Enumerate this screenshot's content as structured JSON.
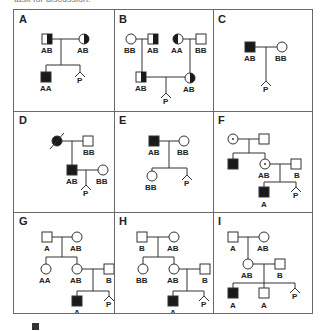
{
  "header_fragment": "task for discussion.",
  "footer_fragment": "",
  "colors": {
    "line": "#333333",
    "fill": "#1a1a1a",
    "border": "#6a6a6a",
    "background": "#ffffff"
  },
  "panels": [
    {
      "id": "A",
      "label": "A",
      "individuals": [
        {
          "sex": "male",
          "status": "carrier-half",
          "genotype": "AB"
        },
        {
          "sex": "female",
          "status": "carrier-half",
          "genotype": "AB"
        },
        {
          "sex": "male",
          "status": "affected",
          "genotype": "AA"
        },
        {
          "sex": "unknown",
          "status": "pregnancy",
          "genotype": "P"
        }
      ]
    },
    {
      "id": "B",
      "label": "B",
      "individuals": [
        {
          "sex": "female",
          "status": "unaffected",
          "genotype": "BB"
        },
        {
          "sex": "male",
          "status": "carrier-half",
          "genotype": "AB"
        },
        {
          "sex": "female",
          "status": "carrier-half",
          "genotype": "AA"
        },
        {
          "sex": "male",
          "status": "unaffected",
          "genotype": "BB"
        },
        {
          "sex": "male",
          "status": "carrier-half",
          "genotype": "AB"
        },
        {
          "sex": "female",
          "status": "carrier-half",
          "genotype": "AB"
        },
        {
          "sex": "unknown",
          "status": "pregnancy",
          "genotype": "P"
        }
      ]
    },
    {
      "id": "C",
      "label": "C",
      "individuals": [
        {
          "sex": "male",
          "status": "affected",
          "genotype": "AB"
        },
        {
          "sex": "female",
          "status": "unaffected",
          "genotype": "BB"
        },
        {
          "sex": "unknown",
          "status": "pregnancy",
          "genotype": "P"
        }
      ]
    },
    {
      "id": "D",
      "label": "D",
      "individuals": [
        {
          "sex": "female",
          "status": "affected-deceased",
          "genotype": ""
        },
        {
          "sex": "male",
          "status": "unaffected",
          "genotype": "BB"
        },
        {
          "sex": "male",
          "status": "affected",
          "genotype": "AB"
        },
        {
          "sex": "female",
          "status": "unaffected",
          "genotype": "BB"
        },
        {
          "sex": "unknown",
          "status": "pregnancy",
          "genotype": "P"
        }
      ]
    },
    {
      "id": "E",
      "label": "E",
      "individuals": [
        {
          "sex": "male",
          "status": "affected",
          "genotype": "AB"
        },
        {
          "sex": "female",
          "status": "unaffected",
          "genotype": "BB"
        },
        {
          "sex": "female",
          "status": "unaffected",
          "genotype": "BB"
        },
        {
          "sex": "unknown",
          "status": "pregnancy",
          "genotype": "P"
        }
      ]
    },
    {
      "id": "F",
      "label": "F",
      "individuals": [
        {
          "sex": "female",
          "status": "carrier-dot",
          "genotype": ""
        },
        {
          "sex": "male",
          "status": "unaffected",
          "genotype": ""
        },
        {
          "sex": "male",
          "status": "affected",
          "genotype": ""
        },
        {
          "sex": "female",
          "status": "carrier-dot",
          "genotype": "AB"
        },
        {
          "sex": "male",
          "status": "unaffected",
          "genotype": "B"
        },
        {
          "sex": "male",
          "status": "affected",
          "genotype": "A"
        },
        {
          "sex": "unknown",
          "status": "pregnancy",
          "genotype": "P"
        }
      ]
    },
    {
      "id": "G",
      "label": "G",
      "individuals": [
        {
          "sex": "male",
          "status": "unaffected",
          "genotype": "A"
        },
        {
          "sex": "female",
          "status": "unaffected",
          "genotype": "AB"
        },
        {
          "sex": "female",
          "status": "unaffected",
          "genotype": "AA"
        },
        {
          "sex": "female",
          "status": "unaffected",
          "genotype": "AB"
        },
        {
          "sex": "male",
          "status": "unaffected",
          "genotype": "B"
        },
        {
          "sex": "male",
          "status": "affected",
          "genotype": "A"
        },
        {
          "sex": "unknown",
          "status": "pregnancy",
          "genotype": "P"
        }
      ]
    },
    {
      "id": "H",
      "label": "H",
      "individuals": [
        {
          "sex": "male",
          "status": "unaffected",
          "genotype": "B"
        },
        {
          "sex": "female",
          "status": "unaffected",
          "genotype": "AB"
        },
        {
          "sex": "female",
          "status": "unaffected",
          "genotype": "BB"
        },
        {
          "sex": "female",
          "status": "unaffected",
          "genotype": "AB"
        },
        {
          "sex": "male",
          "status": "unaffected",
          "genotype": "B"
        },
        {
          "sex": "male",
          "status": "affected",
          "genotype": "A"
        },
        {
          "sex": "unknown",
          "status": "pregnancy",
          "genotype": "P"
        }
      ]
    },
    {
      "id": "I",
      "label": "I",
      "individuals": [
        {
          "sex": "male",
          "status": "unaffected",
          "genotype": "A"
        },
        {
          "sex": "female",
          "status": "unaffected",
          "genotype": "AB"
        },
        {
          "sex": "female",
          "status": "unaffected",
          "genotype": "AB"
        },
        {
          "sex": "male",
          "status": "unaffected",
          "genotype": "B"
        },
        {
          "sex": "male",
          "status": "affected",
          "genotype": "A"
        },
        {
          "sex": "male",
          "status": "unaffected",
          "genotype": "A"
        },
        {
          "sex": "unknown",
          "status": "pregnancy",
          "genotype": "P"
        }
      ]
    }
  ]
}
